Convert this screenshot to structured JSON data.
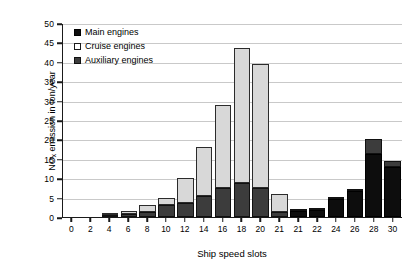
{
  "chart_data": {
    "type": "bar",
    "title": "",
    "subtitle": "",
    "xlabel": "Ship speed slots",
    "ylabel": "NOx emission in ton/year",
    "ylabel_prefix": "NO",
    "ylabel_sub": "x",
    "ylabel_suffix": " emission in ton/year",
    "stacked": true,
    "grid": true,
    "legend_position": "top-left",
    "ylim": [
      0,
      50
    ],
    "yticks": [
      0,
      5,
      10,
      15,
      20,
      25,
      30,
      35,
      40,
      45,
      50
    ],
    "categories": [
      "0",
      "2",
      "4",
      "6",
      "8",
      "10",
      "12",
      "14",
      "16",
      "18",
      "20",
      "21",
      "21",
      "22",
      "24",
      "26",
      "28",
      "30"
    ],
    "series": [
      {
        "name": "Main engines",
        "color": "#0d0d0d",
        "values": [
          0,
          0,
          0,
          0,
          0,
          0,
          0,
          0,
          0,
          0,
          0,
          0,
          1.6,
          1.8,
          4.6,
          6.6,
          16.3,
          13.0
        ]
      },
      {
        "name": "Cruise engines",
        "color": "#d8d8d8",
        "values": [
          0,
          0,
          0.5,
          0.7,
          1.6,
          1.8,
          6.4,
          12.6,
          21.5,
          34.8,
          32.0,
          4.6,
          0,
          0,
          0,
          0,
          0,
          0
        ]
      },
      {
        "name": "Auxiliary engines",
        "color": "#3c3c3c",
        "values": [
          0,
          0,
          0.6,
          0.8,
          1.4,
          3.2,
          3.6,
          5.4,
          7.5,
          8.7,
          7.5,
          1.4,
          0.4,
          0.4,
          0.4,
          0.4,
          3.7,
          1.5
        ]
      }
    ],
    "totals": [
      0,
      0,
      1.1,
      1.5,
      3.0,
      5.0,
      10.0,
      18.0,
      29.0,
      43.5,
      39.5,
      6.0,
      2.0,
      2.2,
      5.0,
      7.0,
      20.0,
      14.5
    ]
  },
  "legend": {
    "items": [
      {
        "label": "Main engines",
        "swatch": "main"
      },
      {
        "label": "Cruise engines",
        "swatch": "cruise"
      },
      {
        "label": "Auxiliary engines",
        "swatch": "aux"
      }
    ]
  }
}
